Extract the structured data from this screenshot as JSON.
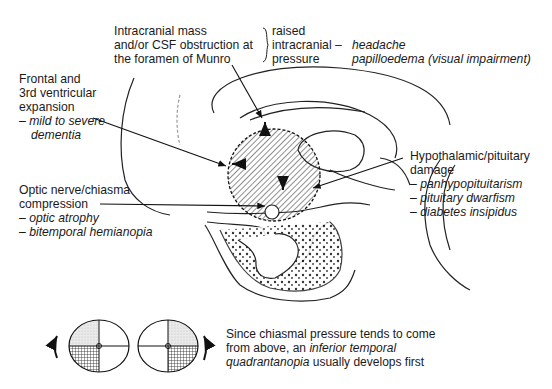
{
  "labels": {
    "mass": [
      "Intracranial mass",
      "and/or CSF obstruction at",
      "the foramen of Munro"
    ],
    "raised": [
      "raised",
      "intracranial –",
      "pressure"
    ],
    "raised_effects": [
      "headache",
      "papilloedema (visual impairment)"
    ],
    "frontal": {
      "lines": [
        "Frontal and",
        "3rd ventricular",
        "expansion"
      ],
      "effects": [
        "– mild to severe",
        "dementia"
      ]
    },
    "optic": {
      "lines": [
        "Optic nerve/chiasma",
        "compression"
      ],
      "effects": [
        "– optic atrophy",
        "– bitemporal hemianopia"
      ]
    },
    "hypo": {
      "lines": [
        "Hypothalamic/pituitary",
        "damage"
      ],
      "effects": [
        "– panhypopituitarism",
        "– pituitary dwarfism",
        "– diabetes insipidus"
      ]
    }
  },
  "caption": {
    "part1": "Since chiasmal pressure tends to come",
    "part2": "from above, an ",
    "italic1": "inferior temporal",
    "italic2": "quadrantanopia",
    "part3": " usually develops first"
  },
  "visual_fields": [
    {
      "eye": "left",
      "shaded_upper": "upper-left",
      "cross_hatched": "lower-left",
      "arrow": "left-upward"
    },
    {
      "eye": "right",
      "shaded_upper": "upper-right",
      "cross_hatched": "lower-right",
      "arrow": "right-upward"
    }
  ]
}
